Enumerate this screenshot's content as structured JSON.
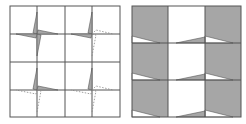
{
  "figure": {
    "panels": [
      {
        "id": "left",
        "description": "4x4 square grid with pinwheel (four-blade star) motifs at interior grid vertices; solid grey blades and dashed outline blades",
        "grid": {
          "columns": 4,
          "rows": 4
        },
        "pinwheels": [
          {
            "position": "top-left",
            "filled_blades": [
              "up",
              "right",
              "down",
              "left"
            ],
            "dashed_blades": []
          },
          {
            "position": "top-right",
            "filled_blades": [
              "up",
              "left"
            ],
            "dashed_blades": [
              "right",
              "down"
            ]
          },
          {
            "position": "bottom-left",
            "filled_blades": [
              "up",
              "right"
            ],
            "dashed_blades": [
              "left",
              "down"
            ]
          },
          {
            "position": "bottom-right",
            "filled_blades": [
              "up"
            ],
            "dashed_blades": [
              "left",
              "right",
              "down"
            ]
          }
        ]
      },
      {
        "id": "right",
        "description": "3x3 grid; columns 1 and 3 shaded grey with white wedge at bottom of each cell, column 2 white with small grey wedge at bottom-right of each cell",
        "grid": {
          "columns": 3,
          "rows": 3
        }
      }
    ],
    "colors": {
      "line": "#555555",
      "fill": "#a6a6a6",
      "dashed": "#888888",
      "background": "#ffffff"
    }
  }
}
